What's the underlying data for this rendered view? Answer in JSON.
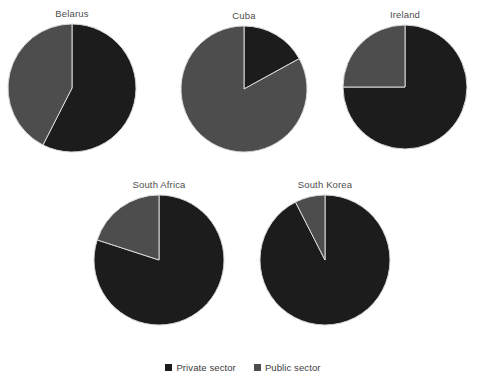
{
  "chart_data": {
    "type": "pie",
    "title": "",
    "subtitle": "",
    "xlabel": "",
    "ylabel": "",
    "grid": false,
    "legend_position": "bottom",
    "categories": [
      "Private sector",
      "Public sector"
    ],
    "colors": {
      "private_sector": "#1c1c1c",
      "public_sector": "#4d4d4d",
      "slice_border": "#d9d9d9",
      "background": "#ffffff",
      "title_text": "#4e4e4e",
      "legend_text": "#3c3c3c"
    },
    "units": "percent",
    "panels": [
      {
        "title": "Belarus",
        "values": [
          57.5,
          42.5
        ],
        "slices": [
          {
            "label": "Private sector",
            "value": 57.5,
            "color": "#1c1c1c"
          },
          {
            "label": "Public sector",
            "value": 42.5,
            "color": "#4d4d4d"
          }
        ]
      },
      {
        "title": "Cuba",
        "values": [
          17,
          83
        ],
        "slices": [
          {
            "label": "Private sector",
            "value": 17,
            "color": "#1c1c1c"
          },
          {
            "label": "Public sector",
            "value": 83,
            "color": "#4d4d4d"
          }
        ]
      },
      {
        "title": "Ireland",
        "values": [
          75,
          25
        ],
        "slices": [
          {
            "label": "Private sector",
            "value": 75,
            "color": "#1c1c1c"
          },
          {
            "label": "Public sector",
            "value": 25,
            "color": "#4d4d4d"
          }
        ]
      },
      {
        "title": "South Africa",
        "values": [
          80,
          20
        ],
        "slices": [
          {
            "label": "Private sector",
            "value": 80,
            "color": "#1c1c1c"
          },
          {
            "label": "Public sector",
            "value": 20,
            "color": "#4d4d4d"
          }
        ]
      },
      {
        "title": "South Korea",
        "values": [
          92.5,
          7.5
        ],
        "slices": [
          {
            "label": "Private sector",
            "value": 92.5,
            "color": "#1c1c1c"
          },
          {
            "label": "Public sector",
            "value": 7.5,
            "color": "#4d4d4d"
          }
        ]
      }
    ]
  },
  "legend": {
    "items": [
      {
        "label": "Private sector",
        "color": "#1c1c1c"
      },
      {
        "label": "Public sector",
        "color": "#4d4d4d"
      }
    ]
  },
  "layout": {
    "panels": [
      {
        "cx": 72,
        "cy": 97,
        "r": 64,
        "title_y": 8
      },
      {
        "cx": 244,
        "cy": 99,
        "r": 63,
        "title_y": 10
      },
      {
        "cx": 405,
        "cy": 96,
        "r": 62,
        "title_y": 9
      },
      {
        "cx": 159,
        "cy": 268,
        "r": 65,
        "title_y": 179
      },
      {
        "cx": 325,
        "cy": 268,
        "r": 65,
        "title_y": 179
      }
    ]
  }
}
